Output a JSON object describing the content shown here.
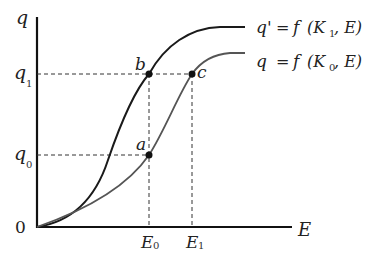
{
  "axes": {
    "y_label": "q",
    "x_label": "E",
    "origin_label": "0"
  },
  "y_ticks": [
    {
      "base": "q",
      "sub": "1"
    },
    {
      "base": "q",
      "sub": "0"
    }
  ],
  "x_ticks": [
    {
      "base": "E",
      "sub": "0"
    },
    {
      "base": "E",
      "sub": "1"
    }
  ],
  "points": [
    {
      "label": "a"
    },
    {
      "label": "b"
    },
    {
      "label": "c"
    }
  ],
  "curves": [
    {
      "name": "top",
      "lhs": "q'",
      "eq": "=",
      "f": "f",
      "open": "(K",
      "sub": "1",
      "rest": ", E)",
      "color": "#1a1a1a"
    },
    {
      "name": "bottom",
      "lhs": "q",
      "eq": "=",
      "f": "f",
      "open": "(K",
      "sub": "0",
      "rest": ", E)",
      "color": "#555555"
    }
  ]
}
